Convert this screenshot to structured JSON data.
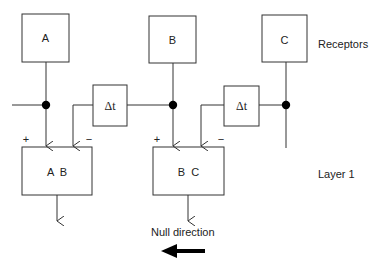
{
  "receptors": [
    {
      "id": "A",
      "label": "A"
    },
    {
      "id": "B",
      "label": "B"
    },
    {
      "id": "C",
      "label": "C"
    }
  ],
  "delays": [
    {
      "label": "Δt"
    },
    {
      "label": "Δt"
    }
  ],
  "units": [
    {
      "label": "A  B",
      "plus": "+",
      "minus": "−"
    },
    {
      "label": "B  C",
      "plus": "+",
      "minus": "−"
    }
  ],
  "side_labels": {
    "receptors": "Receptors",
    "layer": "Layer 1"
  },
  "null_direction": {
    "label": "Null direction",
    "arrow": "left-arrow-icon"
  },
  "colors": {
    "line": "#333333",
    "node": "#000000",
    "text": "#222222"
  }
}
